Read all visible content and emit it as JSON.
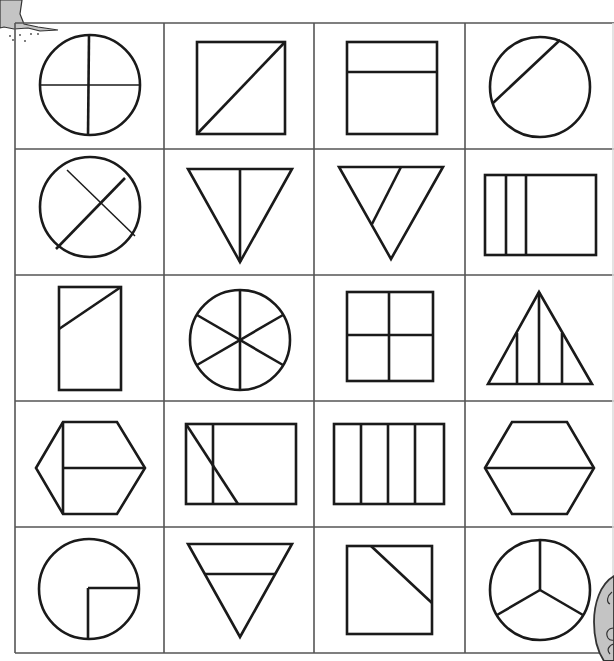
{
  "worksheet": {
    "title": "Fraction shapes grid",
    "rows": 5,
    "columns": 4,
    "colors": {
      "line": "#1a1a1a",
      "grid": "#555555",
      "background": "#ffffff",
      "decoration": "#c4c4c4"
    },
    "cells": [
      {
        "row": 1,
        "col": 1,
        "shape": "circle",
        "division": "4 equal parts (cross)"
      },
      {
        "row": 1,
        "col": 2,
        "shape": "square",
        "division": "diagonal, 2 parts"
      },
      {
        "row": 1,
        "col": 3,
        "shape": "square",
        "division": "horizontal line near top, 2 unequal parts"
      },
      {
        "row": 1,
        "col": 4,
        "shape": "circle",
        "division": "off-center chord, 2 unequal parts"
      },
      {
        "row": 2,
        "col": 1,
        "shape": "circle",
        "division": "one diameter and one chord"
      },
      {
        "row": 2,
        "col": 2,
        "shape": "inverted triangle",
        "division": "vertical median, 2 equal parts"
      },
      {
        "row": 2,
        "col": 3,
        "shape": "inverted triangle",
        "division": "slanted line, 2 unequal parts"
      },
      {
        "row": 2,
        "col": 4,
        "shape": "rectangle",
        "division": "two vertical lines near left, 3 unequal parts"
      },
      {
        "row": 3,
        "col": 1,
        "shape": "tall rectangle",
        "division": "slanted line near top"
      },
      {
        "row": 3,
        "col": 2,
        "shape": "circle",
        "division": "6 equal parts"
      },
      {
        "row": 3,
        "col": 3,
        "shape": "square",
        "division": "4 equal parts (cross)"
      },
      {
        "row": 3,
        "col": 4,
        "shape": "triangle",
        "division": "three vertical lines, 4 unequal parts"
      },
      {
        "row": 4,
        "col": 1,
        "shape": "hexagon",
        "division": "vertical line and half horizontal line"
      },
      {
        "row": 4,
        "col": 2,
        "shape": "rectangle",
        "division": "vertical line and diagonal"
      },
      {
        "row": 4,
        "col": 3,
        "shape": "rectangle",
        "division": "4 equal vertical strips"
      },
      {
        "row": 4,
        "col": 4,
        "shape": "hexagon",
        "division": "horizontal line, 2 equal parts"
      },
      {
        "row": 5,
        "col": 1,
        "shape": "circle",
        "division": "quarter marked (L-shape)"
      },
      {
        "row": 5,
        "col": 2,
        "shape": "inverted triangle",
        "division": "horizontal line near top"
      },
      {
        "row": 5,
        "col": 3,
        "shape": "square",
        "division": "corner cut by slanted line"
      },
      {
        "row": 5,
        "col": 4,
        "shape": "circle",
        "division": "3 equal parts"
      }
    ]
  },
  "decorations": {
    "top_left": "tree-trunk-illustration",
    "bottom_right": "cartoon-character-illustration"
  }
}
